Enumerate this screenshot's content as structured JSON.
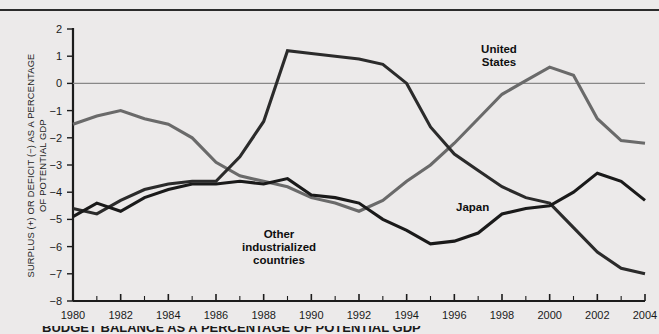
{
  "chart_data": {
    "type": "line",
    "title": "",
    "xlabel": "",
    "ylabel": "SURPLUS (+) OR DEFICIT (−) AS A PERCENTAGE\nOF POTENTIAL GDP",
    "xlim": [
      1980,
      2004
    ],
    "ylim": [
      -8,
      2
    ],
    "xticks": [
      1980,
      1982,
      1984,
      1986,
      1988,
      1990,
      1992,
      1994,
      1996,
      1998,
      2000,
      2002,
      2004
    ],
    "xtick_labels": [
      "1980",
      "1982",
      "1984",
      "1986",
      "1988",
      "1990",
      "1992",
      "1994",
      "1996",
      "1998",
      "2000",
      "2002",
      "2004"
    ],
    "xminor_step": 1,
    "yticks": [
      2,
      1,
      0,
      -1,
      -2,
      -3,
      -4,
      -5,
      -6,
      -7,
      -8
    ],
    "ytick_labels": [
      "2",
      "1",
      "0",
      "−1",
      "−2",
      "−3",
      "−4",
      "−5",
      "−6",
      "−7",
      "−8"
    ],
    "grid": false,
    "zero_line": 0,
    "legend_position": "inline-annotations",
    "x": [
      1980,
      1981,
      1982,
      1983,
      1984,
      1985,
      1986,
      1987,
      1988,
      1989,
      1990,
      1991,
      1992,
      1993,
      1994,
      1995,
      1996,
      1997,
      1998,
      1999,
      2000,
      2001,
      2002,
      2003,
      2004
    ],
    "series": [
      {
        "name": "United States",
        "color": "#6a6a6a",
        "label_text": "United\nStates",
        "values": [
          -1.5,
          -1.2,
          -1.0,
          -1.3,
          -1.5,
          -2.0,
          -2.9,
          -3.4,
          -3.6,
          -3.8,
          -4.2,
          -4.4,
          -4.7,
          -4.3,
          -3.6,
          -3.0,
          -2.2,
          -1.3,
          -0.4,
          0.1,
          0.6,
          0.3,
          -1.3,
          -2.1,
          -2.2
        ]
      },
      {
        "name": "Other industrialized countries",
        "color": "#2b2b2b",
        "label_text": "Other\nindustrialized\ncountries",
        "values": [
          -4.6,
          -4.8,
          -4.3,
          -3.9,
          -3.7,
          -3.6,
          -3.6,
          -2.7,
          -1.4,
          1.2,
          1.1,
          1.0,
          0.9,
          0.7,
          0.0,
          -1.6,
          -2.6,
          -3.2,
          -3.8,
          -4.2,
          -4.4,
          -5.3,
          -6.2,
          -6.8,
          -7.0
        ]
      },
      {
        "name": "Japan",
        "color": "#1a1a1a",
        "label_text": "Japan",
        "values": [
          -4.9,
          -4.4,
          -4.7,
          -4.2,
          -3.9,
          -3.7,
          -3.7,
          -3.6,
          -3.7,
          -3.5,
          -4.1,
          -4.2,
          -4.4,
          -5.0,
          -5.4,
          -5.9,
          -5.8,
          -5.5,
          -4.8,
          -4.6,
          -4.5,
          -4.0,
          -3.3,
          -3.6,
          -4.3
        ]
      }
    ]
  },
  "annotations": {
    "united_states": {
      "line1": "United",
      "line2": "States"
    },
    "other_industrialized": {
      "line1": "Other",
      "line2": "industrialized",
      "line3": "countries"
    },
    "japan": {
      "line1": "Japan"
    }
  },
  "caption": {
    "text": "BUDGET BALANCE AS A PERCENTAGE OF POTENTIAL GDP"
  },
  "colors": {
    "background": "#eceaea",
    "axis": "#1c1c1c",
    "zero_line": "#888888",
    "series_us": "#6a6a6a",
    "series_other": "#2b2b2b",
    "series_japan": "#1a1a1a"
  }
}
